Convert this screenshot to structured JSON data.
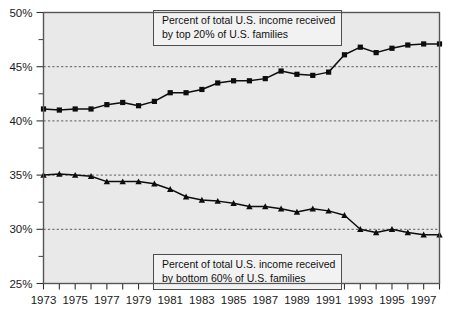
{
  "chart_data": {
    "type": "line",
    "title": "",
    "subtitle": "",
    "xlabel": "",
    "ylabel": "",
    "xlim": [
      1973,
      1998
    ],
    "ylim": [
      25,
      50
    ],
    "grid": true,
    "gridlines_y": [
      30,
      35,
      40,
      45
    ],
    "legend_position": "none",
    "y_tick_labels": [
      "50%",
      "45%",
      "40%",
      "35%",
      "30%",
      "25%"
    ],
    "y_tick_values": [
      50,
      45,
      40,
      35,
      30,
      25
    ],
    "y_minor_tick_values": [
      47.5,
      42.5,
      37.5,
      32.5,
      27.5
    ],
    "x_tick_labels": [
      "1973",
      "1975",
      "1977",
      "1979",
      "1981",
      "1983",
      "1985",
      "1987",
      "1989",
      "1991",
      "1993",
      "1995",
      "1997"
    ],
    "x_tick_values": [
      1973,
      1975,
      1977,
      1979,
      1981,
      1983,
      1985,
      1987,
      1989,
      1991,
      1993,
      1995,
      1997
    ],
    "x_all_ticks": [
      1973,
      1974,
      1975,
      1976,
      1977,
      1978,
      1979,
      1980,
      1981,
      1982,
      1983,
      1984,
      1985,
      1986,
      1987,
      1988,
      1989,
      1990,
      1991,
      1992,
      1993,
      1994,
      1995,
      1996,
      1997,
      1998
    ],
    "x": [
      1973,
      1974,
      1975,
      1976,
      1977,
      1978,
      1979,
      1980,
      1981,
      1982,
      1983,
      1984,
      1985,
      1986,
      1987,
      1988,
      1989,
      1990,
      1991,
      1992,
      1993,
      1994,
      1995,
      1996,
      1997,
      1998
    ],
    "series": [
      {
        "name": "Percent of total U.S. income received by top 20% of U.S. families",
        "marker": "square",
        "color": "#0d0d0d",
        "values": [
          41.1,
          41.0,
          41.1,
          41.1,
          41.5,
          41.7,
          41.4,
          41.8,
          42.6,
          42.6,
          42.9,
          43.5,
          43.7,
          43.7,
          43.9,
          44.6,
          44.3,
          44.2,
          44.5,
          46.1,
          46.8,
          46.3,
          46.7,
          47.0,
          47.1,
          47.1
        ],
        "marker_positions_note": "squares at every year"
      },
      {
        "name": "Percent of total U.S. income received by bottom 60% of U.S. families",
        "marker": "triangle",
        "color": "#0d0d0d",
        "values": [
          35.0,
          35.1,
          35.0,
          34.9,
          34.4,
          34.4,
          34.4,
          34.2,
          33.7,
          33.0,
          32.7,
          32.6,
          32.4,
          32.1,
          32.1,
          31.9,
          31.6,
          31.9,
          31.7,
          31.3,
          30.0,
          29.7,
          30.0,
          29.7,
          29.5,
          29.5
        ],
        "marker_positions_note": "triangles at every year"
      }
    ],
    "annotations": [
      {
        "id": "top-annotation",
        "line1": "Percent of total U.S. income received",
        "line2": "by top 20% of U.S. families"
      },
      {
        "id": "bottom-annotation",
        "line1": "Percent of total U.S. income received",
        "line2": "by bottom 60% of  U.S. families"
      }
    ],
    "colors": {
      "plot_background": "#e9e9e9",
      "page_background": "#ffffff",
      "line": "#0d0d0d",
      "grid": "#4a4a4a",
      "annotation_box_fill": "#f2f2f2",
      "annotation_box_border": "#4d4d4d"
    }
  }
}
